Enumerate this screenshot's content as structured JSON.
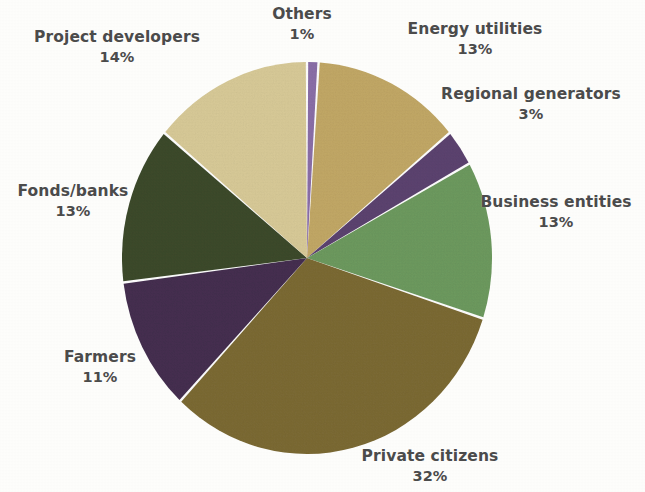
{
  "chart_data": {
    "type": "pie",
    "title": "",
    "subtitle": "",
    "xlabel": "",
    "ylabel": "",
    "legend_position": "none",
    "labels_position": "outside-callout",
    "grid": false,
    "start_angle_deg": 0,
    "direction": "clockwise",
    "units": "percent",
    "total": 100,
    "categories": [
      "Others",
      "Energy utilities",
      "Regional generators",
      "Business entities",
      "Private citizens",
      "Farmers",
      "Fonds/banks",
      "Project developers"
    ],
    "values": [
      1,
      13,
      3,
      13,
      32,
      11,
      13,
      14
    ],
    "value_labels": [
      "1%",
      "13%",
      "3%",
      "13%",
      "32%",
      "11%",
      "13%",
      "14%"
    ],
    "colors": [
      "#8b6fa8",
      "#c2a866",
      "#5c4370",
      "#6d9a5f",
      "#7c6a34",
      "#453050",
      "#3d4a2c",
      "#d8ca98"
    ],
    "slices": [
      {
        "label": "Others",
        "value": 1,
        "value_label": "1%",
        "color": "#8b6fa8"
      },
      {
        "label": "Energy utilities",
        "value": 13,
        "value_label": "13%",
        "color": "#c2a866"
      },
      {
        "label": "Regional generators",
        "value": 3,
        "value_label": "3%",
        "color": "#5c4370"
      },
      {
        "label": "Business entities",
        "value": 13,
        "value_label": "13%",
        "color": "#6d9a5f"
      },
      {
        "label": "Private citizens",
        "value": 32,
        "value_label": "32%",
        "color": "#7c6a34"
      },
      {
        "label": "Farmers",
        "value": 11,
        "value_label": "11%",
        "color": "#453050"
      },
      {
        "label": "Fonds/banks",
        "value": 13,
        "value_label": "13%",
        "color": "#3d4a2c"
      },
      {
        "label": "Project developers",
        "value": 14,
        "value_label": "14%",
        "color": "#d8ca98"
      }
    ]
  },
  "labels": {
    "others": {
      "name": "Others",
      "value": "1%"
    },
    "energy_utilities": {
      "name": "Energy utilities",
      "value": "13%"
    },
    "regional_generators": {
      "name": "Regional generators",
      "value": "3%"
    },
    "business_entities": {
      "name": "Business entities",
      "value": "13%"
    },
    "private_citizens": {
      "name": "Private citizens",
      "value": "32%"
    },
    "farmers": {
      "name": "Farmers",
      "value": "11%"
    },
    "fonds_banks": {
      "name": "Fonds/banks",
      "value": "13%"
    },
    "project_developers": {
      "name": "Project developers",
      "value": "14%"
    }
  },
  "style": {
    "background": "#fdfdfb",
    "label_color": "#4b4b4b",
    "slice_gap_color": "#ffffff"
  },
  "geometry": {
    "center_x": 307,
    "center_y": 258,
    "radius_x": 185,
    "radius_y": 196
  }
}
